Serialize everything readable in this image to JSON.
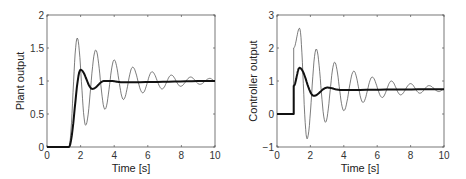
{
  "chart_data": [
    {
      "type": "line",
      "title": "",
      "xlabel": "Time [s]",
      "ylabel": "Plant output",
      "xlim": [
        0,
        10
      ],
      "ylim": [
        0,
        2
      ],
      "xticks": [
        "0",
        "2",
        "4",
        "6",
        "8",
        "10"
      ],
      "yticks": [
        "0",
        "0.5",
        "1",
        "1.5",
        "2"
      ],
      "grid": false,
      "legend": null,
      "series": [
        {
          "name": "thin (oscillatory response)",
          "style": "thin",
          "x": [
            0,
            1.3,
            1.8,
            2.3,
            2.9,
            3.45,
            4.0,
            4.55,
            5.1,
            5.7,
            6.25,
            6.85,
            7.4,
            7.95,
            8.55,
            9.1,
            9.7,
            10
          ],
          "y": [
            0,
            0,
            1.65,
            0.33,
            1.47,
            0.57,
            1.32,
            0.72,
            1.21,
            0.82,
            1.14,
            0.88,
            1.09,
            0.92,
            1.06,
            0.95,
            1.04,
            1.0
          ]
        },
        {
          "name": "thick (well-damped response)",
          "style": "thick",
          "x": [
            0,
            1.3,
            2.0,
            2.7,
            3.4,
            3.8,
            4.5,
            10
          ],
          "y": [
            0,
            0,
            1.17,
            0.88,
            1.0,
            1.0,
            0.98,
            1.0
          ]
        }
      ]
    },
    {
      "type": "line",
      "title": "",
      "xlabel": "Time [s]",
      "ylabel": "Controller output",
      "xlim": [
        0,
        10
      ],
      "ylim": [
        -1,
        3
      ],
      "xticks": [
        "0",
        "2",
        "4",
        "6",
        "8",
        "10"
      ],
      "yticks": [
        "-1",
        "0",
        "1",
        "2",
        "3"
      ],
      "grid": false,
      "legend": null,
      "series": [
        {
          "name": "thin (oscillatory control)",
          "style": "thin",
          "x": [
            0,
            1.0,
            1.0,
            1.35,
            1.8,
            2.35,
            2.9,
            3.45,
            4.0,
            4.6,
            5.15,
            5.7,
            6.3,
            6.85,
            7.4,
            8.0,
            8.55,
            9.1,
            9.7,
            10
          ],
          "y": [
            0,
            0,
            2.0,
            2.6,
            -0.75,
            1.97,
            -0.25,
            1.57,
            0.1,
            1.3,
            0.35,
            1.12,
            0.5,
            1.0,
            0.58,
            0.92,
            0.63,
            0.86,
            0.68,
            0.75
          ]
        },
        {
          "name": "thick (well-damped control)",
          "style": "thick",
          "x": [
            0,
            1.0,
            1.0,
            1.35,
            2.2,
            3.0,
            3.8,
            10
          ],
          "y": [
            0,
            0,
            0.85,
            1.4,
            0.55,
            0.8,
            0.73,
            0.75
          ]
        }
      ]
    }
  ],
  "plots": [
    {
      "ylabel": "Plant output",
      "xlabel": "Time [s]"
    },
    {
      "ylabel": "Controller output",
      "xlabel": "Time [s]"
    }
  ]
}
